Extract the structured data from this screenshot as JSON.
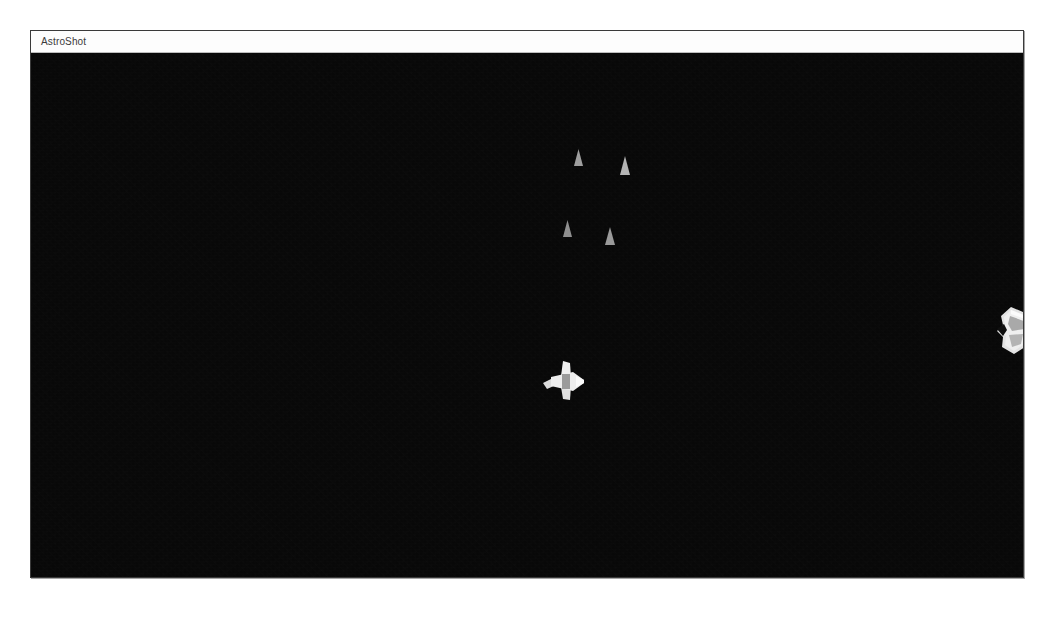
{
  "window": {
    "title": "AstroShot",
    "bounds": {
      "x": 30,
      "y": 30,
      "width": 994,
      "height": 548
    },
    "title_bar_height": 22,
    "has_window_controls": false,
    "desktop_background_color": "#ffffff",
    "border_color": "#3a3a3a",
    "title_bar_color": "#fdfdfd",
    "title_text_color": "#3b3b3b"
  },
  "game": {
    "name": "AstroShot",
    "canvas": {
      "background_color": "#080808",
      "width": 992,
      "height": 525,
      "hud_visible": false,
      "score_text": "",
      "lives_text": ""
    },
    "player": {
      "label": "player-ship",
      "color": "#e8e8e8",
      "shadow_color": "#9a9a9a",
      "x": 512,
      "y": 308,
      "width": 42,
      "height": 40
    },
    "enemies": [
      {
        "label": "asteroid",
        "color": "#dcdcdc",
        "shadow_color": "#8d8d8d",
        "x": 966,
        "y": 254,
        "width": 36,
        "height": 48
      }
    ],
    "projectiles": [
      {
        "label": "bullet",
        "color": "#9e9e9e",
        "x": 543,
        "y": 96,
        "width": 9,
        "height": 17
      },
      {
        "label": "bullet",
        "color": "#b4b4b4",
        "x": 589,
        "y": 103,
        "width": 10,
        "height": 19
      },
      {
        "label": "bullet",
        "color": "#8f8f8f",
        "x": 532,
        "y": 167,
        "width": 9,
        "height": 17
      },
      {
        "label": "bullet",
        "color": "#9a9a9a",
        "x": 574,
        "y": 174,
        "width": 10,
        "height": 18
      }
    ]
  }
}
